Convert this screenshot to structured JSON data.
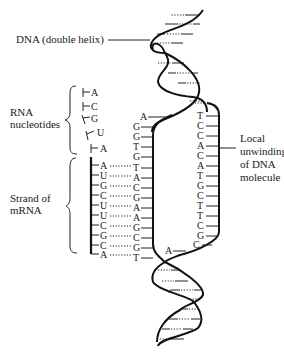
{
  "labels": {
    "dna": "DNA (double helix)",
    "rna_nucleotides_1": "RNA",
    "rna_nucleotides_2": "nucleotides",
    "mrna_1": "Strand of",
    "mrna_2": "mRNA",
    "unwinding_1": "Local",
    "unwinding_2": "unwinding",
    "unwinding_3": "of DNA",
    "unwinding_4": "molecule"
  },
  "free_nucleotides": [
    "A",
    "C",
    "G",
    "U",
    "A"
  ],
  "mrna_strand": [
    "A",
    "U",
    "G",
    "C",
    "U",
    "U",
    "C",
    "G",
    "C",
    "A"
  ],
  "template_strand": {
    "top_overhang": "A",
    "unpaired": [
      "G",
      "G",
      "T",
      "G"
    ],
    "paired": [
      "T",
      "A",
      "C",
      "G",
      "A",
      "A",
      "G",
      "C",
      "G",
      "T"
    ]
  },
  "coding_strand": [
    "T",
    "C",
    "C",
    "A",
    "C",
    "A",
    "T",
    "G",
    "C",
    "T",
    "T",
    "C",
    "G",
    "C"
  ],
  "coding_bottom": "A"
}
